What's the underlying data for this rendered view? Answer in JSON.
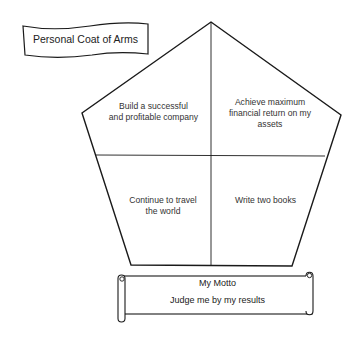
{
  "title_banner": {
    "label": "Personal Coat of Arms"
  },
  "shield": {
    "quadrants": [
      {
        "position": "top-left",
        "text": "Build a successful and profitable company",
        "lines": [
          "Build a successful",
          "and profitable company"
        ]
      },
      {
        "position": "top-right",
        "text": "Achieve maximum financial return on my assets",
        "lines": [
          "Achieve maximum",
          "financial return on my",
          "assets"
        ]
      },
      {
        "position": "bottom-left",
        "text": "Continue to travel the world",
        "lines": [
          "Continue to travel",
          "the world"
        ]
      },
      {
        "position": "bottom-right",
        "text": "Write two books",
        "lines": [
          "Write two books"
        ]
      }
    ]
  },
  "motto_scroll": {
    "heading": "My Motto",
    "text": "Judge me by my results"
  },
  "colors": {
    "stroke": "#1a1a1a",
    "background": "#ffffff",
    "text": "#333333"
  }
}
